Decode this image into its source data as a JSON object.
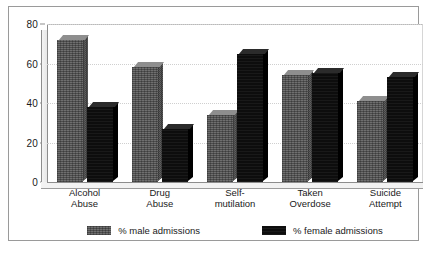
{
  "chart_data": {
    "type": "bar",
    "title": "",
    "subtitle": "",
    "xlabel": "",
    "ylabel": "",
    "ylim": [
      0,
      80
    ],
    "yticks": [
      "0",
      "20",
      "40",
      "60",
      "80"
    ],
    "grid": true,
    "legend_position": "bottom",
    "categories": [
      "Alcohol\nAbuse",
      "Drug\nAbuse",
      "Self-\nmutilation",
      "Taken\nOverdose",
      "Suicide\nAttempt"
    ],
    "category_lines": [
      [
        "Alcohol",
        "Abuse"
      ],
      [
        "Drug",
        "Abuse"
      ],
      [
        "Self-",
        "mutilation"
      ],
      [
        "Taken",
        "Overdose"
      ],
      [
        "Suicide",
        "Attempt"
      ]
    ],
    "series": [
      {
        "name": "% male admissions",
        "color": "#6f6f6f",
        "values": [
          72,
          58,
          34,
          54,
          41
        ]
      },
      {
        "name": "% female admissions",
        "color": "#0d0d0d",
        "values": [
          38,
          27,
          65,
          55,
          53
        ]
      }
    ]
  },
  "legend": {
    "items": [
      {
        "label": "% male admissions",
        "swatch": "male-series-swatch"
      },
      {
        "label": "% female admissions",
        "swatch": "female-series-swatch"
      }
    ]
  }
}
